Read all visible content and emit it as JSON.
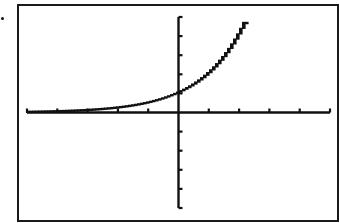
{
  "chart_data": {
    "type": "line",
    "title": "",
    "xlabel": "",
    "ylabel": "",
    "function_hint": "exponential growth (approx. y = 2^x)",
    "xlim": [
      -5,
      5
    ],
    "ylim": [
      -5,
      5
    ],
    "x_tick_step": 1,
    "y_tick_step": 1,
    "grid": false,
    "legend": null,
    "series": [
      {
        "name": "curve",
        "x": [
          -5,
          -4,
          -3,
          -2,
          -1,
          0,
          0.5,
          1,
          1.5,
          2,
          2.32
        ],
        "y": [
          0.03,
          0.06,
          0.13,
          0.25,
          0.5,
          1,
          1.41,
          2,
          2.83,
          4,
          5
        ]
      }
    ],
    "annotations": []
  },
  "screen": {
    "frame_color": "#1a1a1a",
    "axis_color": "#111111",
    "curve_color": "#111111",
    "background": "#ffffff"
  },
  "labels": {
    "bullet": "•"
  }
}
